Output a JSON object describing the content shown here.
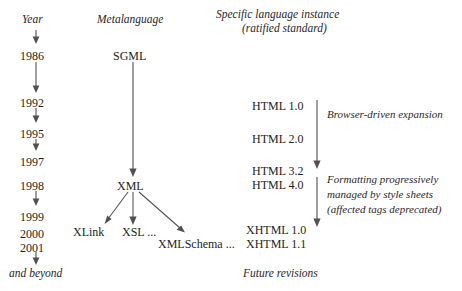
{
  "diagram": {
    "columns": {
      "year_header": "Year",
      "metalanguage_header": "Metalanguage",
      "instance_header_line1": "Specific language instance",
      "instance_header_line2": "(ratified standard)"
    },
    "years": [
      {
        "label": "1986"
      },
      {
        "label": "1992"
      },
      {
        "label": "1995"
      },
      {
        "label": "1997"
      },
      {
        "label": "1998"
      },
      {
        "label": "1999"
      },
      {
        "label": "2000"
      },
      {
        "label": "2001"
      }
    ],
    "year_footer": "and beyond",
    "metalanguage_nodes": [
      {
        "label": "SGML"
      },
      {
        "label": "XML"
      },
      {
        "label": "XLink"
      },
      {
        "label": "XSL ..."
      },
      {
        "label": "XMLSchema ..."
      }
    ],
    "instances": [
      {
        "label": "HTML 1.0"
      },
      {
        "label": "HTML 2.0"
      },
      {
        "label": "HTML 3.2"
      },
      {
        "label": "HTML 4.0"
      },
      {
        "label": "XHTML 1.0"
      },
      {
        "label": "XHTML 1.1"
      }
    ],
    "instance_footer": "Future revisions",
    "annotations": {
      "browser_expansion": "Browser-driven expansion",
      "style_sheets_line1": "Formatting  progressively",
      "style_sheets_line2": "managed by style sheets",
      "style_sheets_line3": "(affected tags deprecated)"
    },
    "colors": {
      "text": "#231f20",
      "line": "#54504f",
      "background": "#ffffff"
    }
  }
}
